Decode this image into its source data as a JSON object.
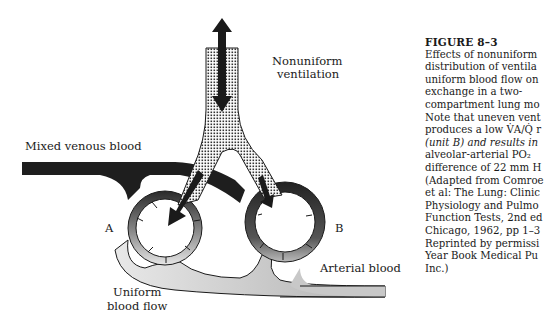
{
  "figure": {
    "title": "FIGURE 8–3",
    "caption_lines": [
      "Effects of nonuniform",
      "distribution of ventila",
      "uniform blood flow on",
      "exchange in a two-",
      "compartment lung mo",
      "Note that uneven vent",
      "produces a low V̇A/Q̇ r",
      "(unit B) and results in",
      "alveolar-arterial PO₂",
      "difference of 22 mm H",
      "(Adapted from Comroe",
      "et al: The Lung: Clinic",
      "Physiology and Pulmo",
      "Function Tests, 2nd ed",
      "Chicago, 1962, pp 1–3",
      "Reprinted by permissi",
      "Year Book Medical Pu",
      "Inc.)"
    ]
  },
  "diagram": {
    "labels": {
      "ventilation_1": "Nonuniform",
      "ventilation_2": "ventilation",
      "venous": "Mixed venous blood",
      "unit_a": "A",
      "unit_b": "B",
      "arterial": "Arterial blood",
      "flow_1": "Uniform",
      "flow_2": "blood flow"
    },
    "colors": {
      "ink": "#1a1a1a",
      "dark_blood": "#2a2a2a",
      "light_blood": "#cfcfcf"
    }
  }
}
